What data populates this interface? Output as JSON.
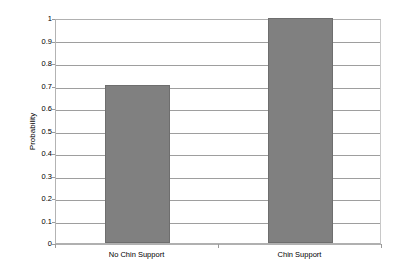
{
  "chart_data": {
    "type": "bar",
    "title": "",
    "xlabel": "",
    "ylabel": "Probability",
    "categories": [
      "No Chin Support",
      "Chin Support"
    ],
    "values": [
      0.7,
      1.0
    ],
    "ylim": [
      0,
      1
    ],
    "ytick_step": 0.1,
    "ytick_labels": [
      "1",
      "0.9",
      "0.8",
      "0.7",
      "0.6",
      "0.5",
      "0.4",
      "0.3",
      "0.2",
      "0.1",
      "0"
    ],
    "ytick_values": [
      1,
      0.9,
      0.8,
      0.7,
      0.6,
      0.5,
      0.4,
      0.3,
      0.2,
      0.1,
      0
    ],
    "grid": true,
    "legend": false,
    "legend_position": "none",
    "series": [
      {
        "name": "Probability",
        "values": [
          0.7,
          1.0
        ],
        "color": "#808080"
      }
    ],
    "bar_color": "#808080",
    "bar_border_color": "#6e6e6e",
    "gridline_color": "#9e9e9e",
    "axis_color": "#b0b0b0",
    "background": "#ffffff"
  }
}
